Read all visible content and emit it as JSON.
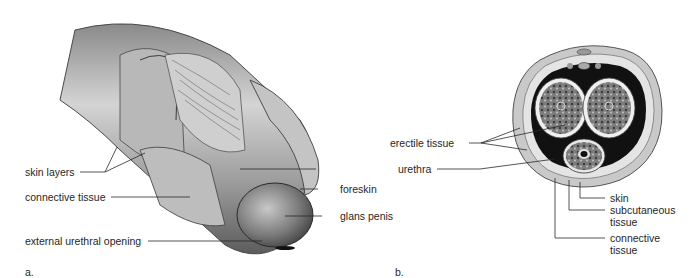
{
  "figure": {
    "panels": [
      {
        "id": "a",
        "panel_label": "a.",
        "view": "cutaway side view",
        "labels": {
          "skin_layers": "skin layers",
          "connective_tissue": "connective tissue",
          "external_urethral_opening": "external urethral opening",
          "urethra": "urethra",
          "foreskin": "foreskin",
          "glans_penis": "glans penis"
        }
      },
      {
        "id": "b",
        "panel_label": "b.",
        "view": "cross section",
        "labels": {
          "erectile_tissue": "erectile tissue",
          "skin": "skin",
          "subcutaneous_tissue_line1": "subcutaneous",
          "subcutaneous_tissue_line2": "tissue",
          "connective_tissue_line1": "connective",
          "connective_tissue_line2": "tissue"
        }
      }
    ],
    "colors": {
      "background": "#ffffff",
      "text": "#1f1f1f",
      "leader_line": "#2a2a2a",
      "tissue_light": "#d9d9d9",
      "tissue_mid": "#a8a8a8",
      "tissue_dark": "#555555",
      "cavity": "#111111"
    }
  }
}
